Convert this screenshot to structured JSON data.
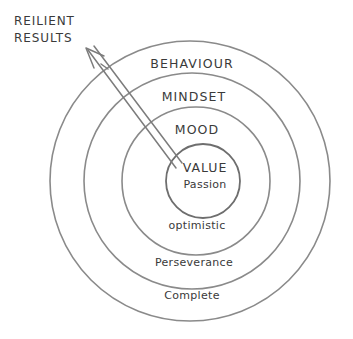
{
  "diagram": {
    "type": "concentric-circles",
    "title_callout": {
      "line1": "REILIENT",
      "line2": "RESULTS"
    },
    "colors": {
      "background": "#ffffff",
      "stroke": "#8a8a8a",
      "text": "#3a3a3a",
      "arrow": "#7c7c7c"
    },
    "rings": [
      {
        "label": "BEHAVIOUR",
        "style": "upper",
        "level": 1
      },
      {
        "label": "MINDSET",
        "style": "upper",
        "level": 2
      },
      {
        "label": "MOOD",
        "style": "upper",
        "level": 3
      },
      {
        "label": "VALUE",
        "style": "upper",
        "level": 4
      },
      {
        "label": "Passion",
        "style": "lower",
        "level": 4
      },
      {
        "label": "optimistic",
        "style": "lower",
        "level": 3
      },
      {
        "label": "Perseverance",
        "style": "lower",
        "level": 2
      },
      {
        "label": "Complete",
        "style": "lower",
        "level": 1
      }
    ],
    "arrow": {
      "from": "VALUE",
      "to": "REILIENT RESULTS",
      "direction": "up-left"
    }
  }
}
